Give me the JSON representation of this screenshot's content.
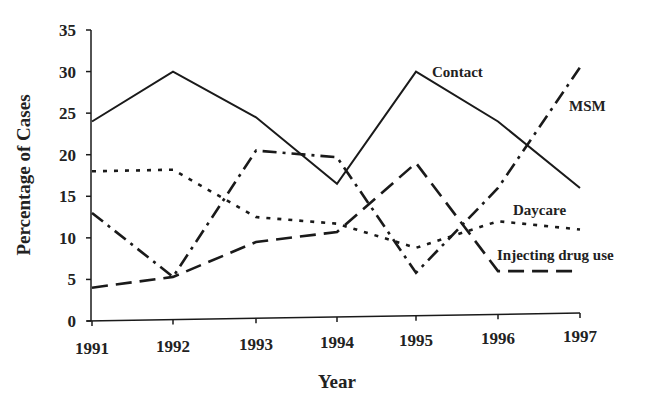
{
  "chart_data": {
    "type": "line",
    "title": "",
    "xlabel": "Year",
    "ylabel": "Percentage of Cases",
    "x": [
      "1991",
      "1992",
      "1993",
      "1994",
      "1995",
      "1996",
      "1997"
    ],
    "ylim": [
      0,
      35
    ],
    "yticks": [
      0,
      5,
      10,
      15,
      20,
      25,
      30,
      35
    ],
    "grid": false,
    "legend": "inline labels at line ends",
    "series": [
      {
        "name": "Contact",
        "style": "solid",
        "values": [
          24,
          30,
          24.5,
          16.5,
          30,
          24,
          16
        ]
      },
      {
        "name": "MSM",
        "style": "dash-dot",
        "values": [
          13,
          5.3,
          20.5,
          19.7,
          5.8,
          16,
          30.5
        ]
      },
      {
        "name": "Daycare",
        "style": "dotted",
        "values": [
          18,
          18.2,
          12.5,
          11.7,
          8.8,
          12,
          11
        ]
      },
      {
        "name": "Injecting drug use",
        "style": "dashed",
        "values": [
          4,
          5.3,
          9.5,
          10.7,
          19,
          6,
          6
        ]
      }
    ]
  },
  "labels": {
    "ylabel": "Percentage of Cases",
    "xlabel": "Year",
    "contact": "Contact",
    "msm": "MSM",
    "daycare": "Daycare",
    "idu": "Injecting drug use"
  },
  "colors": {
    "line": "#1a1a1a",
    "text": "#222222",
    "background": "#ffffff"
  }
}
